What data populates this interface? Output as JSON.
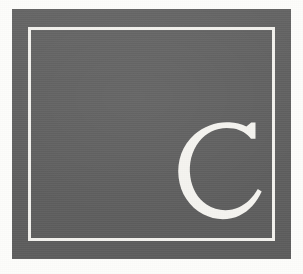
{
  "page": {
    "background_color": "#fdfdfb",
    "width": 303,
    "height": 274
  },
  "panel": {
    "name": "gray-plate",
    "fill_color": "#616161",
    "x": 12,
    "y": 9,
    "width": 279,
    "height": 250
  },
  "keyline": {
    "name": "inner-white-rule",
    "stroke_color": "#f3f2ee",
    "stroke_width": 3,
    "inset_x": 16,
    "inset_y": 18
  },
  "letterform": {
    "character": "C",
    "label": "Capital letter C",
    "case": "uppercase",
    "style": "serif",
    "fill_color": "#f5f4f0",
    "position": "lower-right",
    "x": 160,
    "y": 112,
    "width": 120,
    "height": 120
  },
  "caption": {
    "alt_text": "A white serif capital letter C set in the lower right of a gray rectangular plate with a thin white inner border."
  }
}
